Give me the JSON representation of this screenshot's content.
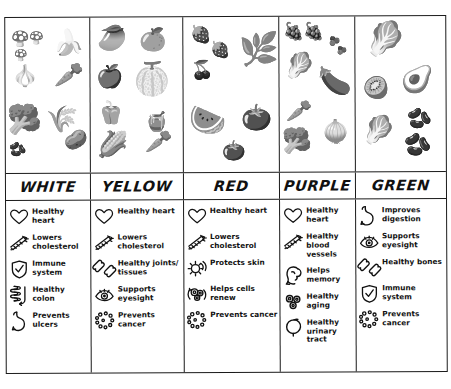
{
  "chart": {
    "title_cropped": "",
    "columns": [
      {
        "color_name": "WHITE",
        "accent": "#ffffff",
        "produce": [
          {
            "icon": "mushroom-icon",
            "label": "mushroom",
            "x": 6,
            "y": 14,
            "size": 15
          },
          {
            "icon": "mushroom-icon",
            "label": "mushroom",
            "x": 24,
            "y": 14,
            "size": 12
          },
          {
            "icon": "mushroom-icon",
            "label": "mushroom",
            "x": 9,
            "y": 32,
            "size": 11
          },
          {
            "icon": "garlic-icon",
            "label": "garlic",
            "x": 6,
            "y": 48,
            "size": 21
          },
          {
            "icon": "banana-icon",
            "label": "banana",
            "x": 48,
            "y": 12,
            "size": 25
          },
          {
            "icon": "parsnip-icon",
            "label": "parsnip",
            "x": 48,
            "y": 45,
            "size": 24
          },
          {
            "icon": "cauliflower-icon",
            "label": "cauliflower",
            "x": 1,
            "y": 88,
            "size": 28
          },
          {
            "icon": "beans-icon",
            "label": "beans",
            "x": 3,
            "y": 124,
            "size": 14
          },
          {
            "icon": "leek-icon",
            "label": "leek",
            "x": 40,
            "y": 88,
            "size": 26
          },
          {
            "icon": "potato-icon",
            "label": "potato",
            "x": 58,
            "y": 112,
            "size": 19
          }
        ],
        "benefits": [
          {
            "icon": "heart-icon",
            "label": "Healthy heart"
          },
          {
            "icon": "artery-icon",
            "label": "Lowers cholesterol"
          },
          {
            "icon": "shield-check-icon",
            "label": "Immune system"
          },
          {
            "icon": "intestine-icon",
            "label": "Healthy colon"
          },
          {
            "icon": "stomach-icon",
            "label": "Prevents ulcers"
          }
        ]
      },
      {
        "color_name": "YELLOW",
        "accent": "#f2c200",
        "produce": [
          {
            "icon": "mango-icon",
            "label": "mango",
            "x": 6,
            "y": 8,
            "size": 24
          },
          {
            "icon": "orange-icon",
            "label": "orange",
            "x": 48,
            "y": 12,
            "size": 22
          },
          {
            "icon": "apple-icon",
            "label": "apple",
            "x": 5,
            "y": 48,
            "size": 22
          },
          {
            "icon": "melon-icon",
            "label": "cantaloupe",
            "x": 41,
            "y": 46,
            "size": 32
          },
          {
            "icon": "pepper-icon",
            "label": "bell pepper",
            "x": 6,
            "y": 84,
            "size": 22
          },
          {
            "icon": "squash-icon",
            "label": "squash",
            "x": 54,
            "y": 95,
            "size": 19
          },
          {
            "icon": "corn-icon",
            "label": "corn",
            "x": 6,
            "y": 114,
            "size": 25
          },
          {
            "icon": "carrot-icon",
            "label": "carrot",
            "x": 54,
            "y": 114,
            "size": 22
          }
        ],
        "benefits": [
          {
            "icon": "heart-icon",
            "label": "Healthy heart"
          },
          {
            "icon": "artery-icon",
            "label": "Lowers cholesterol"
          },
          {
            "icon": "bone-icon",
            "label": "Healthy joints/ tissues"
          },
          {
            "icon": "eye-icon",
            "label": "Supports eyesight"
          },
          {
            "icon": "cancer-cells-icon",
            "label": "Prevents cancer"
          }
        ]
      },
      {
        "color_name": "RED",
        "accent": "#d62828",
        "produce": [
          {
            "icon": "strawberry-icon",
            "label": "strawberry",
            "x": 7,
            "y": 9,
            "size": 17
          },
          {
            "icon": "strawberry-icon",
            "label": "strawberry",
            "x": 27,
            "y": 25,
            "size": 16
          },
          {
            "icon": "cherries-icon",
            "label": "cherries",
            "x": 8,
            "y": 44,
            "size": 18
          },
          {
            "icon": "rhubarb-icon",
            "label": "rhubarb",
            "x": 56,
            "y": 16,
            "size": 32
          },
          {
            "icon": "watermelon-icon",
            "label": "watermelon",
            "x": 6,
            "y": 88,
            "size": 30
          },
          {
            "icon": "pomegranate-icon",
            "label": "pomegranate",
            "x": 58,
            "y": 88,
            "size": 25
          },
          {
            "icon": "tomato-icon",
            "label": "tomato",
            "x": 38,
            "y": 124,
            "size": 19
          }
        ],
        "benefits": [
          {
            "icon": "heart-icon",
            "label": "Healthy heart"
          },
          {
            "icon": "artery-icon",
            "label": "Lowers cholesterol"
          },
          {
            "icon": "sun-icon",
            "label": "Protects skin"
          },
          {
            "icon": "cells-renew-icon",
            "label": "Helps cells renew"
          },
          {
            "icon": "cancer-cells-icon",
            "label": "Prevents cancer"
          }
        ]
      },
      {
        "color_name": "PURPLE",
        "accent": "#6a2c8f",
        "produce": [
          {
            "icon": "grapes-icon",
            "label": "grapes",
            "x": 4,
            "y": 6,
            "size": 17
          },
          {
            "icon": "grapes-icon",
            "label": "grapes",
            "x": 24,
            "y": 6,
            "size": 17
          },
          {
            "icon": "berry-icon",
            "label": "berry",
            "x": 50,
            "y": 20,
            "size": 9
          },
          {
            "icon": "berry-icon",
            "label": "berry",
            "x": 58,
            "y": 30,
            "size": 8
          },
          {
            "icon": "cabbage-icon",
            "label": "cabbage",
            "x": 4,
            "y": 36,
            "size": 25
          },
          {
            "icon": "eggplant-icon",
            "label": "eggplant",
            "x": 38,
            "y": 50,
            "size": 27
          },
          {
            "icon": "carrot-icon",
            "label": "carrot",
            "x": 6,
            "y": 84,
            "size": 21
          },
          {
            "icon": "broccoli-icon",
            "label": "broccoli",
            "x": 2,
            "y": 112,
            "size": 24
          },
          {
            "icon": "turnip-icon",
            "label": "turnip",
            "x": 42,
            "y": 104,
            "size": 22
          }
        ],
        "benefits": [
          {
            "icon": "heart-icon",
            "label": "Healthy heart"
          },
          {
            "icon": "artery-icon",
            "label": "Healthy blood vessels"
          },
          {
            "icon": "brain-icon",
            "label": "Helps memory"
          },
          {
            "icon": "cells-icon",
            "label": "Healthy aging"
          },
          {
            "icon": "bladder-icon",
            "label": "Healthy urinary tract"
          }
        ]
      },
      {
        "color_name": "GREEN",
        "accent": "#2e7d32",
        "produce": [
          {
            "icon": "lettuce-icon",
            "label": "lettuce",
            "x": 10,
            "y": 6,
            "size": 33
          },
          {
            "icon": "avocado-icon",
            "label": "avocado",
            "x": 46,
            "y": 50,
            "size": 26
          },
          {
            "icon": "kiwi-icon",
            "label": "kiwi",
            "x": 8,
            "y": 62,
            "size": 21
          },
          {
            "icon": "cabbage-icon",
            "label": "cabbage",
            "x": 6,
            "y": 100,
            "size": 27
          },
          {
            "icon": "greenbean-icon",
            "label": "green bean",
            "x": 52,
            "y": 92,
            "size": 20
          },
          {
            "icon": "peapod-icon",
            "label": "pea pod",
            "x": 48,
            "y": 118,
            "size": 22
          }
        ],
        "benefits": [
          {
            "icon": "stomach-icon",
            "label": "Improves digestion"
          },
          {
            "icon": "eye-icon",
            "label": "Supports eyesight"
          },
          {
            "icon": "bone-icon",
            "label": "Healthy bones"
          },
          {
            "icon": "shield-check-icon",
            "label": "Immune system"
          },
          {
            "icon": "cancer-cells-icon",
            "label": "Prevents cancer"
          }
        ]
      }
    ]
  }
}
